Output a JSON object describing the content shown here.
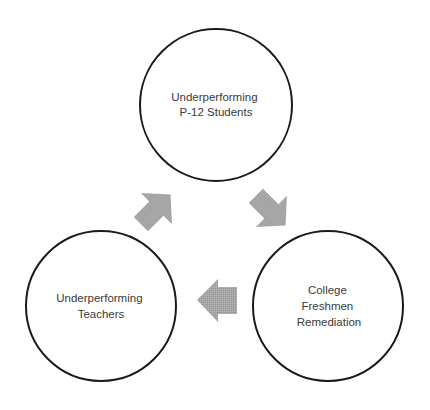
{
  "diagram": {
    "type": "cycle",
    "nodes": [
      {
        "id": "top",
        "lines": [
          "Underperforming",
          "P-12 Students"
        ],
        "cx": 216,
        "cy": 105,
        "r": 77
      },
      {
        "id": "right",
        "lines": [
          "College",
          "Freshmen",
          "Remediation"
        ],
        "cx": 328,
        "cy": 306,
        "r": 76
      },
      {
        "id": "left",
        "lines": [
          "Underperforming",
          "Teachers"
        ],
        "cx": 101,
        "cy": 306,
        "r": 76
      }
    ],
    "edges": [
      {
        "from": "Underperforming P-12 Students",
        "to": "College Freshmen Remediation",
        "direction": "down-right"
      },
      {
        "from": "College Freshmen Remediation",
        "to": "Underperforming Teachers",
        "direction": "left"
      },
      {
        "from": "Underperforming Teachers",
        "to": "Underperforming P-12 Students",
        "direction": "up-right"
      }
    ],
    "colors": {
      "circle_stroke": "#1a1a1a",
      "circle_fill": "#ffffff",
      "label_text": "#3a3a3a",
      "arrow_fill": "#a3a3a3",
      "background": "#ffffff"
    }
  }
}
